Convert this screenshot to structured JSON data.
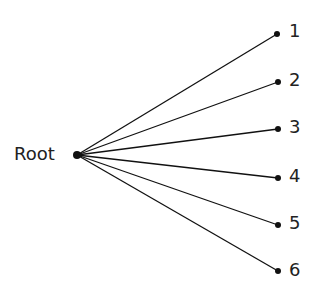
{
  "diagram": {
    "type": "tree",
    "root": {
      "label": "Root",
      "x": 77,
      "y": 155
    },
    "children": [
      {
        "label": "1",
        "x": 277,
        "y": 34
      },
      {
        "label": "2",
        "x": 278,
        "y": 82
      },
      {
        "label": "3",
        "x": 278,
        "y": 129
      },
      {
        "label": "4",
        "x": 278,
        "y": 178
      },
      {
        "label": "5",
        "x": 278,
        "y": 225
      },
      {
        "label": "6",
        "x": 278,
        "y": 271
      }
    ],
    "colors": {
      "line": "#111111",
      "node": "#111111",
      "text": "#222222"
    }
  }
}
